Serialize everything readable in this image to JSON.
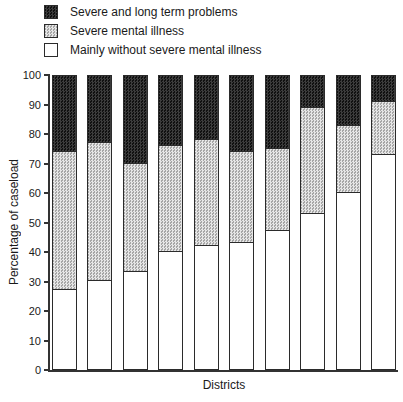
{
  "legend": {
    "items": [
      {
        "label": "Severe and long term problems",
        "swatch": "dark-hatch"
      },
      {
        "label": "Severe mental illness",
        "swatch": "light-stipple"
      },
      {
        "label": "Mainly without severe mental illness",
        "swatch": "white"
      }
    ]
  },
  "chart_data": {
    "type": "bar",
    "stacked": true,
    "num_bars": 10,
    "title": "",
    "xlabel": "Districts",
    "ylabel": "Percentage of caseload",
    "ylim": [
      0,
      100
    ],
    "yticks": [
      0,
      10,
      20,
      30,
      40,
      50,
      60,
      70,
      80,
      90,
      100
    ],
    "x_tick_labels": [],
    "grid": false,
    "legend_position": "top-left",
    "series": [
      {
        "name": "Mainly without severe mental illness",
        "style": "white",
        "values": [
          27,
          30,
          33,
          40,
          42,
          43,
          47,
          53,
          60,
          73
        ]
      },
      {
        "name": "Severe mental illness",
        "style": "light-stipple",
        "values": [
          47,
          47,
          37,
          36,
          36,
          31,
          28,
          36,
          23,
          18
        ]
      },
      {
        "name": "Severe and long term problems",
        "style": "dark-hatch",
        "values": [
          26,
          23,
          30,
          24,
          22,
          26,
          25,
          11,
          17,
          9
        ]
      }
    ]
  },
  "colors": {
    "ink": "#1a1a1a",
    "axis": "#333333",
    "dark_hatch_a": "#101010",
    "dark_hatch_b": "#3c3c3c",
    "stipple_a": "#a6a6a6",
    "stipple_b": "#e6e6e6",
    "bar_outline": "#2b2b2b"
  }
}
